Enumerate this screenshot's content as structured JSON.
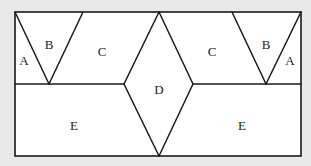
{
  "diagram": {
    "type": "tiling / dissection of a rectangle",
    "colors": {
      "background": "#e9e9e9",
      "fill": "#ffffff",
      "stroke": "#1a1a1a"
    },
    "rectangle": {
      "x": 15,
      "y": 12,
      "width": 286,
      "height": 144
    },
    "midline_y": 84,
    "regions": [
      {
        "id": "A-left",
        "label": "A",
        "x": 24,
        "y": 62
      },
      {
        "id": "B-left",
        "label": "B",
        "x": 49,
        "y": 46
      },
      {
        "id": "C-left",
        "label": "C",
        "x": 102,
        "y": 53
      },
      {
        "id": "D",
        "label": "D",
        "x": 159,
        "y": 91
      },
      {
        "id": "C-right",
        "label": "C",
        "x": 212,
        "y": 53
      },
      {
        "id": "B-right",
        "label": "B",
        "x": 266,
        "y": 46
      },
      {
        "id": "A-right",
        "label": "A",
        "x": 290,
        "y": 62
      },
      {
        "id": "E-left",
        "label": "E",
        "x": 74,
        "y": 127
      },
      {
        "id": "E-right",
        "label": "E",
        "x": 242,
        "y": 127
      }
    ],
    "segments": [
      {
        "name": "left-v-left-edge",
        "x1": 15,
        "y1": 12,
        "x2": 49,
        "y2": 84
      },
      {
        "name": "left-v-right-edge",
        "x1": 83,
        "y1": 12,
        "x2": 49,
        "y2": 84
      },
      {
        "name": "right-v-left-edge",
        "x1": 232,
        "y1": 12,
        "x2": 266,
        "y2": 84
      },
      {
        "name": "right-v-right-edge",
        "x1": 301,
        "y1": 12,
        "x2": 266,
        "y2": 84
      },
      {
        "name": "diamond-top-left",
        "x1": 159,
        "y1": 12,
        "x2": 124,
        "y2": 84
      },
      {
        "name": "diamond-top-right",
        "x1": 159,
        "y1": 12,
        "x2": 193,
        "y2": 84
      },
      {
        "name": "diamond-bottom-left",
        "x1": 124,
        "y1": 84,
        "x2": 159,
        "y2": 156
      },
      {
        "name": "diamond-bottom-right",
        "x1": 193,
        "y1": 84,
        "x2": 159,
        "y2": 156
      },
      {
        "name": "midline-left",
        "x1": 15,
        "y1": 84,
        "x2": 124,
        "y2": 84
      },
      {
        "name": "midline-right",
        "x1": 193,
        "y1": 84,
        "x2": 301,
        "y2": 84
      }
    ]
  }
}
